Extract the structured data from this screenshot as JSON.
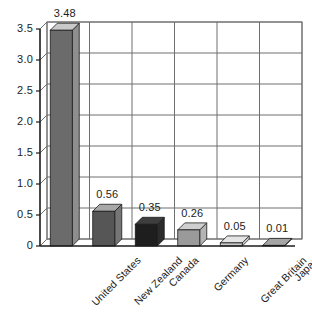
{
  "chart_data": {
    "type": "bar",
    "title": "",
    "subtitle": "",
    "xlabel": "",
    "ylabel": "",
    "categories": [
      "United States",
      "New Zealand",
      "Canada",
      "Germany",
      "Great Britain",
      "Japan"
    ],
    "values": [
      3.48,
      0.56,
      0.35,
      0.26,
      0.05,
      0.01
    ],
    "value_labels": [
      "3.48",
      "0.56",
      "0.35",
      "0.26",
      "0.05",
      "0.01"
    ],
    "ylim": [
      0,
      3.5
    ],
    "ytick_labels": [
      "0",
      "0.5",
      "1.0",
      "1.5",
      "2.0",
      "2.5",
      "3.0",
      "3.5"
    ],
    "ytick_values": [
      0,
      0.5,
      1.0,
      1.5,
      2.0,
      2.5,
      3.0,
      3.5
    ],
    "grid": "horizontal-and-vertical",
    "legend": "none",
    "style": "3d-columns",
    "bar_colors": [
      "#6b6b6b",
      "#565656",
      "#1e1e1e",
      "#9a9a9a",
      "#c8c8c8",
      "#7d7d7d"
    ],
    "bar_top_colors": [
      "#c9c9c9",
      "#a8a8a8",
      "#3e3e3e",
      "#cfcfcf",
      "#e4e4e4",
      "#a5a5a5"
    ],
    "bar_side_colors": [
      "#8e8e8e",
      "#767676",
      "#2b2b2b",
      "#b4b4b4",
      "#d8d8d8",
      "#909090"
    ],
    "plot_bg": "#ffffff",
    "grid_color": "#6f6f6f",
    "axis_color": "#1c1c1c",
    "text_color": "#1c1c1c"
  }
}
